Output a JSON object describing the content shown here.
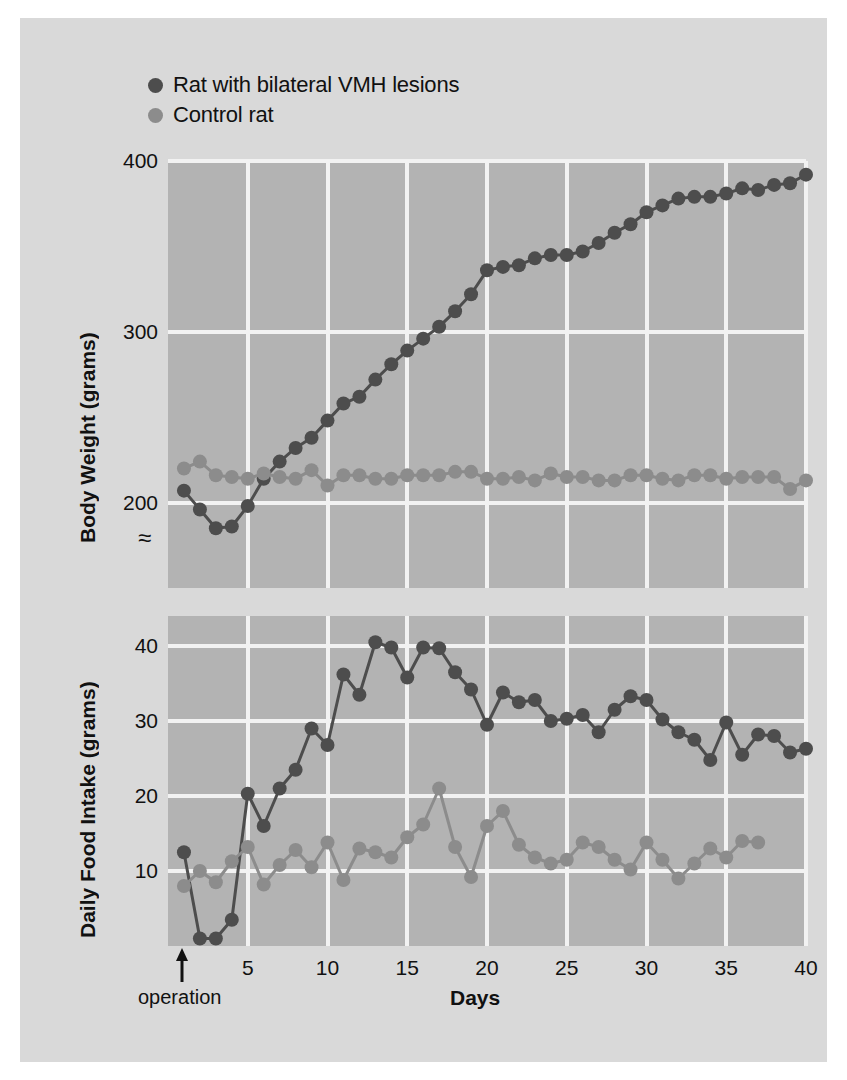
{
  "figure": {
    "background_color": "#d9d9d9",
    "plot_background_color": "#b3b3b3",
    "grid_color": "#f2f2f2"
  },
  "legend": {
    "position": "top-left",
    "entries": [
      {
        "label": "Rat with bilateral VMH lesions",
        "color": "#4d4d4d"
      },
      {
        "label": "Control rat",
        "color": "#8c8c8c"
      }
    ]
  },
  "annotations": {
    "operation_label": "operation",
    "operation_day": 1,
    "axis_break_symbol": "≈"
  },
  "axis": {
    "x_title": "Days",
    "x_ticks": [
      5,
      10,
      15,
      20,
      25,
      30,
      35,
      40
    ],
    "x_min": 0,
    "x_max": 40
  },
  "chart_data": [
    {
      "type": "line",
      "title": "",
      "xlabel": "Days",
      "ylabel": "Body Weight (grams)",
      "xlim": [
        0,
        40
      ],
      "ylim": [
        150,
        400
      ],
      "y_ticks": [
        200,
        300,
        400
      ],
      "x_ticks": [
        5,
        10,
        15,
        20,
        25,
        30,
        35,
        40
      ],
      "grid": true,
      "axis_break": true,
      "legend_position": "above-plot",
      "x": [
        1,
        2,
        3,
        4,
        5,
        6,
        7,
        8,
        9,
        10,
        11,
        12,
        13,
        14,
        15,
        16,
        17,
        18,
        19,
        20,
        21,
        22,
        23,
        24,
        25,
        26,
        27,
        28,
        29,
        30,
        31,
        32,
        33,
        34,
        35,
        36,
        37,
        38,
        39,
        40
      ],
      "series": [
        {
          "name": "Rat with bilateral VMH lesions",
          "color": "#4d4d4d",
          "values": [
            207,
            196,
            185,
            186,
            198,
            214,
            224,
            232,
            238,
            248,
            258,
            262,
            272,
            281,
            289,
            296,
            303,
            312,
            322,
            336,
            338,
            339,
            343,
            345,
            345,
            347,
            352,
            358,
            363,
            370,
            374,
            378,
            379,
            379,
            381,
            384,
            383,
            386,
            387,
            392
          ]
        },
        {
          "name": "Control rat",
          "color": "#8c8c8c",
          "values": [
            220,
            224,
            216,
            215,
            214,
            217,
            215,
            214,
            219,
            210,
            216,
            216,
            214,
            214,
            216,
            216,
            216,
            218,
            218,
            214,
            214,
            215,
            213,
            217,
            215,
            215,
            213,
            213,
            216,
            216,
            214,
            213,
            216,
            216,
            214,
            215,
            215,
            215,
            208,
            213
          ]
        }
      ]
    },
    {
      "type": "line",
      "title": "",
      "xlabel": "Days",
      "ylabel": "Daily Food Intake (grams)",
      "xlim": [
        0,
        40
      ],
      "ylim": [
        0,
        44
      ],
      "y_ticks": [
        10,
        20,
        30,
        40
      ],
      "x_ticks": [
        5,
        10,
        15,
        20,
        25,
        30,
        35,
        40
      ],
      "grid": true,
      "legend_position": "above-plot",
      "x": [
        1,
        2,
        3,
        4,
        5,
        6,
        7,
        8,
        9,
        10,
        11,
        12,
        13,
        14,
        15,
        16,
        17,
        18,
        19,
        20,
        21,
        22,
        23,
        24,
        25,
        26,
        27,
        28,
        29,
        30,
        31,
        32,
        33,
        34,
        35,
        36,
        37,
        38,
        39,
        40
      ],
      "series": [
        {
          "name": "Rat with bilateral VMH lesions",
          "color": "#4d4d4d",
          "values": [
            12.5,
            1.0,
            1.0,
            3.5,
            20.3,
            16.0,
            21.0,
            23.5,
            29.0,
            26.8,
            36.2,
            33.5,
            40.5,
            39.8,
            35.8,
            39.8,
            39.7,
            36.5,
            34.2,
            29.5,
            33.8,
            32.5,
            32.8,
            30.0,
            30.3,
            30.8,
            28.5,
            31.5,
            33.3,
            32.8,
            30.2,
            28.5,
            27.5,
            24.8,
            29.8,
            25.5,
            28.2,
            28.0,
            25.8,
            26.3
          ]
        },
        {
          "name": "Control rat",
          "color": "#8c8c8c",
          "values": [
            8.0,
            10.0,
            8.5,
            11.3,
            13.2,
            8.2,
            10.8,
            12.8,
            10.5,
            13.8,
            8.8,
            13.0,
            12.5,
            11.8,
            14.5,
            16.2,
            21.0,
            13.2,
            9.2,
            16.0,
            18.0,
            13.5,
            11.8,
            11.0,
            11.5,
            13.8,
            13.2,
            11.5,
            10.2,
            13.8,
            11.5,
            9.0,
            11.0,
            13.0,
            11.8,
            14.0,
            13.8
          ]
        }
      ]
    }
  ]
}
